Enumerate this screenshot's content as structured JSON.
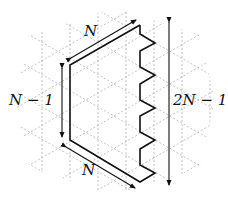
{
  "figure": {
    "labels": {
      "top_edge": "N",
      "left_edge": "N − 1",
      "right_height": "2N − 1",
      "bottom_edge": "N"
    },
    "colors": {
      "grid": "#9a9a9a",
      "outline": "#111111",
      "background": "#ffffff"
    },
    "lattice": {
      "type": "triangular",
      "column_spacing_px": 28,
      "style": "dashed"
    }
  }
}
